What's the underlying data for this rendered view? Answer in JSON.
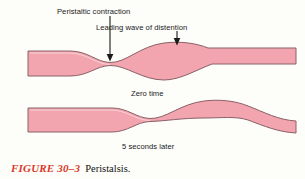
{
  "figure": {
    "number": "FIGURE 30–3",
    "title": "Peristalsis.",
    "number_color": "#d9392b"
  },
  "labels": {
    "peristaltic_contraction": "Peristaltic contraction",
    "leading_wave": "Leading wave of distention",
    "zero_time": "Zero time",
    "five_seconds_later": "5 seconds later"
  },
  "diagram": {
    "type": "anatomical-schematic",
    "background_color": "#fdfdf9",
    "tube_fill_color": "#f2a5af",
    "tube_outline_color": "#8a6168",
    "arrow_color": "#1a1a1a",
    "panels": [
      {
        "name": "zero-time-tube",
        "caption": "Zero time",
        "constriction_x": 110,
        "bulge_x": 178,
        "annotations": [
          "Peristaltic contraction",
          "Leading wave of distention"
        ]
      },
      {
        "name": "five-seconds-later-tube",
        "caption": "5 seconds later",
        "constriction_x": 150,
        "bulge_x": 218,
        "annotations": []
      }
    ],
    "arrows": [
      {
        "name": "peristaltic-contraction-arrow",
        "x": 110,
        "y_start": 16,
        "y_end": 59
      },
      {
        "name": "leading-wave-arrow",
        "x": 177,
        "y_start": 31,
        "y_end": 45
      }
    ]
  }
}
